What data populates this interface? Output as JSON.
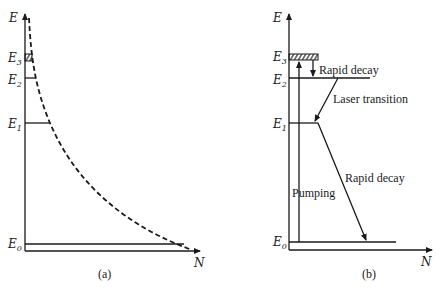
{
  "panel_a": {
    "caption": "(a)",
    "y_axis_label": "E",
    "x_axis_label": "N",
    "levels": [
      {
        "name": "E",
        "sub": "3"
      },
      {
        "name": "E",
        "sub": "2"
      },
      {
        "name": "E",
        "sub": "1"
      },
      {
        "name": "E",
        "sub": "0"
      }
    ],
    "curve_style": "dashed"
  },
  "panel_b": {
    "caption": "(b)",
    "y_axis_label": "E",
    "x_axis_label": "N",
    "levels": [
      {
        "name": "E",
        "sub": "3"
      },
      {
        "name": "E",
        "sub": "2"
      },
      {
        "name": "E",
        "sub": "1"
      },
      {
        "name": "E",
        "sub": "0"
      }
    ],
    "annotations": {
      "rapid_decay_top": "Rapid decay",
      "laser_transition": "Laser transition",
      "rapid_decay_bottom": "Rapid decay",
      "pumping": "Pumping"
    }
  }
}
